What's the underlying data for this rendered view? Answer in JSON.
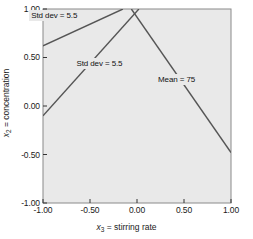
{
  "chart_data": {
    "type": "line",
    "title": "",
    "xlabel": "x3 = stirring rate",
    "ylabel": "x2 = concentration",
    "xlim": [
      -1.0,
      1.0
    ],
    "ylim": [
      -1.0,
      1.0
    ],
    "xticks": [
      "-1.00",
      "-0.50",
      "0.00",
      "0.50",
      "1.00"
    ],
    "xtick_values": [
      -1.0,
      -0.5,
      0.0,
      0.5,
      1.0
    ],
    "yticks": [
      "1.00",
      "0.50",
      "0.00",
      "-0.50",
      "-1.00"
    ],
    "ytick_values": [
      1.0,
      0.5,
      0.0,
      -0.5,
      -1.0
    ],
    "grid": false,
    "legend": "none",
    "plot_background": "#e9e9e9",
    "line_color": "#555555",
    "series": [
      {
        "name": "Std dev = 5.5 (upper)",
        "label": "Std dev = 5.5",
        "x": [
          -1.0,
          -0.15
        ],
        "y": [
          0.62,
          1.0
        ],
        "label_x": -0.88,
        "label_y": 0.93
      },
      {
        "name": "Std dev = 5.5 (lower)",
        "label": "Std dev = 5.5",
        "x": [
          -1.0,
          0.02
        ],
        "y": [
          -0.1,
          1.0
        ],
        "label_x": -0.4,
        "label_y": 0.44
      },
      {
        "name": "Mean = 75",
        "label": "Mean = 75",
        "x": [
          -0.06,
          1.0
        ],
        "y": [
          1.0,
          -0.48
        ],
        "label_x": 0.42,
        "label_y": 0.27
      }
    ],
    "annotations": [
      {
        "text": "Std dev = 5.5",
        "x": -0.88,
        "y": 0.93
      },
      {
        "text": "Std dev = 5.5",
        "x": -0.4,
        "y": 0.44
      },
      {
        "text": "Mean = 75",
        "x": 0.42,
        "y": 0.27
      }
    ]
  }
}
